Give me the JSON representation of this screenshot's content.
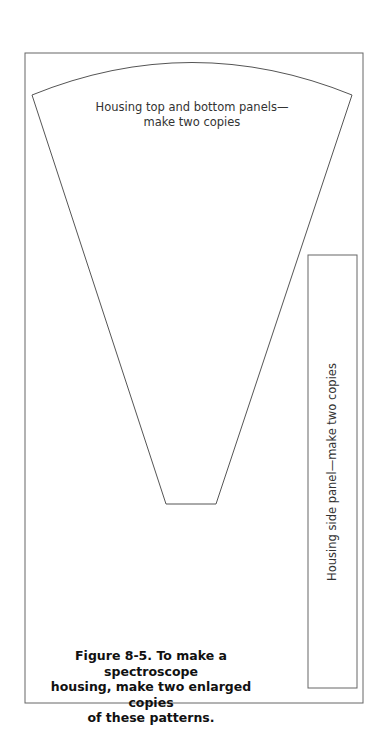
{
  "figure": {
    "top_panel_label_line1": "Housing top and bottom panels—",
    "top_panel_label_line2": "make two copies",
    "side_panel_label": "Housing side panel—make two copies",
    "caption_line1": "Figure 8-5. To make a spectroscope",
    "caption_line2": "housing, make two enlarged copies",
    "caption_line3": "of these patterns.",
    "colors": {
      "line": "#555555",
      "text": "#333333",
      "caption": "#111111"
    }
  }
}
